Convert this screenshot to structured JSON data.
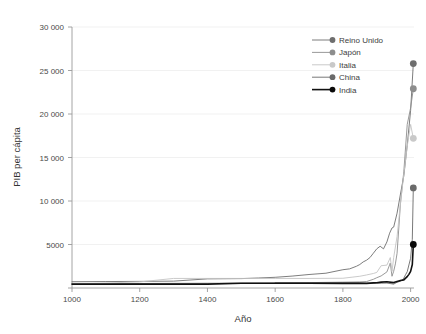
{
  "chart_data": {
    "type": "line",
    "title": "",
    "xlabel": "Año",
    "ylabel": "PIB per cápita",
    "xlim": [
      1000,
      2010
    ],
    "ylim": [
      0,
      30000
    ],
    "grid": true,
    "legend_position": "top-right",
    "x_ticks": [
      "1000",
      "1200",
      "1400",
      "1600",
      "1800",
      "2000"
    ],
    "x_tick_values": [
      1000,
      1200,
      1400,
      1600,
      1800,
      2000
    ],
    "y_ticks": [
      "0",
      "5000",
      "10 000",
      "15 000",
      "20 000",
      "25 000",
      "30 000"
    ],
    "y_tick_values": [
      0,
      5000,
      10000,
      15000,
      20000,
      25000,
      30000
    ],
    "series": [
      {
        "name": "Reino Unido",
        "color": "#6e6e6e",
        "width": 0.9,
        "marker": true,
        "marker_color": "#6e6e6e",
        "end_value": 25800,
        "x": [
          1000,
          1100,
          1200,
          1300,
          1400,
          1500,
          1550,
          1600,
          1650,
          1700,
          1750,
          1800,
          1820,
          1840,
          1850,
          1860,
          1870,
          1880,
          1890,
          1900,
          1910,
          1920,
          1930,
          1938,
          1945,
          1950,
          1960,
          1970,
          1980,
          1990,
          2000,
          2008
        ],
        "values": [
          720,
          740,
          760,
          790,
          1050,
          1080,
          1150,
          1230,
          1370,
          1550,
          1700,
          2100,
          2200,
          2500,
          2700,
          3000,
          3200,
          3500,
          4000,
          4500,
          4800,
          4500,
          5300,
          6300,
          6900,
          7000,
          8600,
          10800,
          12900,
          16400,
          20400,
          25800
        ]
      },
      {
        "name": "Japón",
        "color": "#8d8d8d",
        "width": 0.9,
        "marker": true,
        "marker_color": "#8d8d8d",
        "end_value": 22900,
        "x": [
          1000,
          1200,
          1400,
          1500,
          1600,
          1700,
          1800,
          1850,
          1870,
          1890,
          1900,
          1913,
          1930,
          1940,
          1945,
          1950,
          1955,
          1960,
          1970,
          1980,
          1990,
          2000,
          2008
        ],
        "values": [
          425,
          520,
          550,
          560,
          580,
          620,
          670,
          700,
          740,
          1000,
          1180,
          1390,
          1850,
          2870,
          1350,
          1920,
          2770,
          3990,
          9710,
          13400,
          18800,
          20700,
          22900
        ]
      },
      {
        "name": "Italia",
        "color": "#c4c4c4",
        "width": 0.9,
        "marker": true,
        "marker_color": "#c9c9c9",
        "end_value": 17200,
        "x": [
          1000,
          1200,
          1300,
          1400,
          1500,
          1600,
          1700,
          1800,
          1850,
          1870,
          1890,
          1900,
          1913,
          1930,
          1940,
          1945,
          1950,
          1960,
          1970,
          1980,
          1990,
          2000,
          2008
        ],
        "values": [
          450,
          700,
          1100,
          1100,
          1100,
          1100,
          1100,
          1120,
          1350,
          1500,
          1670,
          1790,
          2560,
          2630,
          3500,
          1900,
          3500,
          5920,
          9720,
          13100,
          16300,
          18800,
          17200
        ]
      },
      {
        "name": "China",
        "color": "#6a6a6a",
        "width": 0.9,
        "marker": true,
        "marker_color": "#6a6a6a",
        "end_value": 11500,
        "x": [
          1600,
          1700,
          1800,
          1850,
          1870,
          1890,
          1900,
          1913,
          1930,
          1950,
          1960,
          1970,
          1978,
          1985,
          1990,
          1995,
          2000,
          2005,
          2008
        ],
        "values": [
          600,
          600,
          600,
          600,
          530,
          540,
          545,
          552,
          568,
          448,
          662,
          778,
          978,
          1520,
          1870,
          2650,
          3420,
          5580,
          11500
        ]
      },
      {
        "name": "India",
        "color": "#111111",
        "width": 1.6,
        "marker": true,
        "marker_color": "#0a0a0a",
        "end_value": 5000,
        "x": [
          1000,
          1200,
          1400,
          1500,
          1600,
          1700,
          1800,
          1850,
          1870,
          1890,
          1900,
          1913,
          1930,
          1950,
          1960,
          1970,
          1980,
          1990,
          1995,
          2000,
          2005,
          2008
        ],
        "values": [
          450,
          450,
          450,
          550,
          550,
          550,
          533,
          533,
          533,
          584,
          599,
          673,
          726,
          619,
          753,
          868,
          938,
          1309,
          1568,
          1910,
          2700,
          5000
        ]
      }
    ]
  },
  "legend": {
    "items": [
      {
        "label": "Reino Unido"
      },
      {
        "label": "Japón"
      },
      {
        "label": "Italia"
      },
      {
        "label": "China"
      },
      {
        "label": "India"
      }
    ]
  }
}
